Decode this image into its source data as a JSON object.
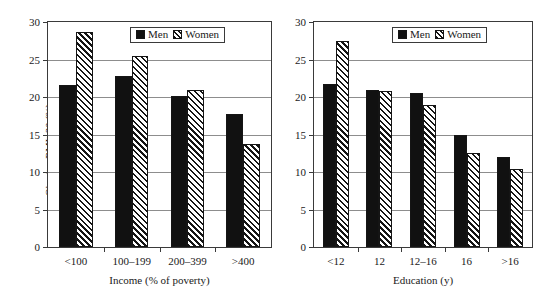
{
  "chart_data": [
    {
      "id": "income-panel",
      "type": "bar",
      "title": "",
      "xlabel": "Income (% of poverty)",
      "ylabel": "Obesity, BMI>30 (%)",
      "categories": [
        "<100",
        "100–199",
        "200–399",
        ">400"
      ],
      "series": [
        {
          "name": "Men",
          "values": [
            21.6,
            22.8,
            20.2,
            17.7
          ]
        },
        {
          "name": "Women",
          "values": [
            28.7,
            25.5,
            21.0,
            13.8
          ]
        }
      ],
      "ylim": [
        0,
        30
      ],
      "yticks": [
        0,
        5,
        10,
        15,
        20,
        25,
        30
      ],
      "ytick_labels": [
        "0",
        "5",
        "10",
        "15",
        "20",
        "25",
        "30"
      ],
      "grid": true,
      "legend_position": "top-center",
      "legend_entries": [
        "Men",
        "Women"
      ]
    },
    {
      "id": "education-panel",
      "type": "bar",
      "title": "",
      "xlabel": "Education (y)",
      "ylabel": "",
      "categories": [
        "<12",
        "12",
        "12–16",
        "16",
        ">16"
      ],
      "series": [
        {
          "name": "Men",
          "values": [
            21.8,
            20.9,
            20.6,
            14.9,
            12.0
          ]
        },
        {
          "name": "Women",
          "values": [
            27.5,
            20.8,
            18.9,
            12.5,
            10.4
          ]
        }
      ],
      "ylim": [
        0,
        30
      ],
      "yticks": [
        0,
        5,
        10,
        15,
        20,
        25,
        30
      ],
      "ytick_labels": [
        "0",
        "5",
        "10",
        "15",
        "20",
        "25",
        "30"
      ],
      "grid": true,
      "legend_position": "top-center",
      "legend_entries": [
        "Men",
        "Women"
      ]
    }
  ],
  "colors": {
    "men_fill": "#111111",
    "women_fill": "#ffffff",
    "women_hatch": "#151515",
    "axis": "#3a3a3a",
    "grid": "#8d8d8d",
    "background": "#ffffff"
  },
  "panels": {
    "left": {
      "y_axis_title": "Obesity, BMI>30 (%)",
      "x_axis_title": "Income (% of poverty)",
      "legend": {
        "men_label": "Men",
        "women_label": "Women"
      }
    },
    "right": {
      "y_axis_title": "",
      "x_axis_title": "Education (y)",
      "legend": {
        "men_label": "Men",
        "women_label": "Women"
      }
    }
  }
}
